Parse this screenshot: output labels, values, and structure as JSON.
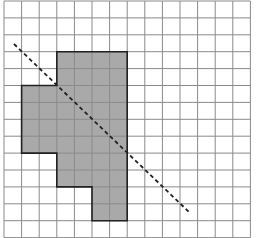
{
  "diagram": {
    "type": "grid-figure",
    "grid": {
      "columns": 14,
      "rows": 14,
      "origin_px": [
        4,
        1
      ],
      "cell_width_px": 17.6,
      "cell_height_px": 16.9,
      "line_color": "#8a8a8a",
      "background": "#ffffff"
    },
    "shaded_shape": {
      "fill": "#a9a9a9",
      "stroke": "#222222",
      "vertices_grid": [
        [
          3,
          3
        ],
        [
          7,
          3
        ],
        [
          7,
          13
        ],
        [
          5,
          13
        ],
        [
          5,
          11
        ],
        [
          3,
          11
        ],
        [
          3,
          9
        ],
        [
          1,
          9
        ],
        [
          1,
          5
        ],
        [
          3,
          5
        ]
      ],
      "cell_count": 36
    },
    "dashed_line": {
      "color": "#222222",
      "start_px": [
        14,
        44
      ],
      "end_px": [
        190,
        213
      ],
      "dash": "4 3"
    }
  }
}
